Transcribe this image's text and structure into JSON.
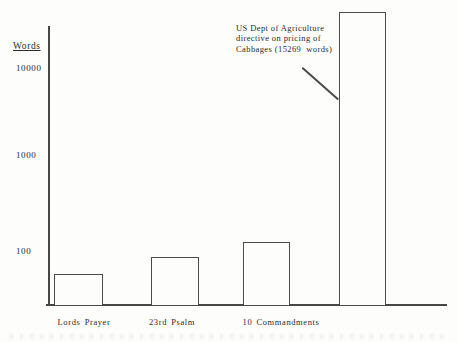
{
  "figure": {
    "y_axis_title": "Words",
    "ytick_labels": {
      "t10000": "10000",
      "t1000": "1000",
      "t100": "100"
    },
    "category_labels": {
      "c0": "Lords Prayer",
      "c1": "23rd Psalm",
      "c2": "10 Commandments"
    },
    "annotation_lines": {
      "l1": "US Dept of Agriculture",
      "l2": "directive on pricing of",
      "l3": "Cabbages (15269  words)"
    }
  },
  "chart_data": {
    "type": "bar",
    "title": "",
    "xlabel": "",
    "ylabel": "Words",
    "yscale": "log",
    "yticks": [
      100,
      1000,
      10000
    ],
    "grid": false,
    "categories": [
      "Lords Prayer",
      "23rd Psalm",
      "10 Commandments",
      "US Dept of Agriculture directive on pricing of Cabbages"
    ],
    "values": [
      56,
      85,
      125,
      15269
    ],
    "values_as_drawn": [
      56,
      85,
      125,
      44000
    ],
    "annotation": "US Dept of Agriculture directive on pricing of Cabbages (15269  words)",
    "line_color": "#4a4a4a",
    "bar_fill": "#fdfdfc"
  }
}
